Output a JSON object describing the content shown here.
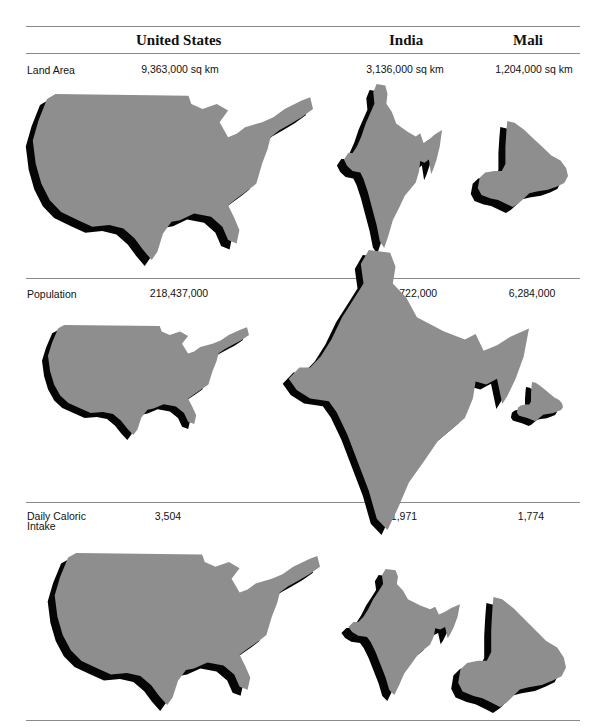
{
  "columns": [
    {
      "key": "us",
      "label": "United States"
    },
    {
      "key": "india",
      "label": "India"
    },
    {
      "key": "mali",
      "label": "Mali"
    }
  ],
  "colors": {
    "land": "#8e8e8e",
    "shadow": "#050505",
    "rule": "#8a8a8a"
  },
  "rows": [
    {
      "key": "land_area",
      "label": "Land Area",
      "values": {
        "us": "9,363,000 sq km",
        "india": "3,136,000 sq km",
        "mali": "1,204,000 sq km"
      }
    },
    {
      "key": "population",
      "label": "Population",
      "values": {
        "us": "218,437,000",
        "india": "660,722,000",
        "mali": "6,284,000"
      }
    },
    {
      "key": "caloric",
      "label": "Daily Caloric Intake",
      "values": {
        "us": "3,504",
        "india": "1,971",
        "mali": "1,774"
      }
    }
  ],
  "chart_data": {
    "type": "table",
    "title": "",
    "subtitle": "Cartogram comparison: map sizes scaled to each metric",
    "categories": [
      "United States",
      "India",
      "Mali"
    ],
    "series": [
      {
        "name": "Land Area",
        "unit": "sq km",
        "values": [
          9363000,
          3136000,
          1204000
        ]
      },
      {
        "name": "Population",
        "unit": "people",
        "values": [
          218437000,
          660722000,
          6284000
        ]
      },
      {
        "name": "Daily Caloric Intake",
        "unit": "kcal",
        "values": [
          3504,
          1971,
          1774
        ]
      }
    ]
  }
}
